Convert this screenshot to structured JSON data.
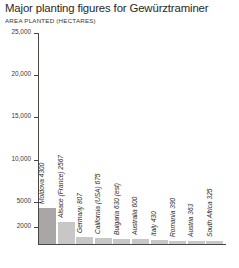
{
  "chart_data": {
    "type": "bar",
    "title": "Major planting figures for Gewürztraminer",
    "subtitle": "AREA PLANTED (HECTARES)",
    "xlabel": "",
    "ylabel": "AREA PLANTED (HECTARES)",
    "ylim": [
      0,
      25000
    ],
    "grid": false,
    "legend": "none",
    "orientation": "vertical",
    "y_ticks": [
      {
        "value": 25000,
        "label": "25,000"
      },
      {
        "value": 20000,
        "label": "20,000"
      },
      {
        "value": 15000,
        "label": "15,000"
      },
      {
        "value": 10000,
        "label": "10,000"
      },
      {
        "value": 5000,
        "label": "5000"
      },
      {
        "value": 2000,
        "label": "2000"
      }
    ],
    "categories": [
      "Moldova",
      "Alsace (France)",
      "Germany",
      "California (USA)",
      "Bulgaria",
      "Australia",
      "Italy",
      "Romania",
      "Austria",
      "South Africa"
    ],
    "values": [
      4300,
      2567,
      807,
      675,
      630,
      600,
      430,
      390,
      363,
      325
    ],
    "bar_labels": [
      "Moldova 4300",
      "Alsace (France) 2567",
      "Germany 807",
      "California (USA) 675",
      "Bulgaria 630 (est)",
      "Australia 600",
      "Italy 430",
      "Romania 390",
      "Austria 363",
      "South Africa 325"
    ],
    "highlight_index": 0,
    "colors": {
      "bar": "#c9c7c5",
      "bar_highlight": "#a9a7a5",
      "axis": "#4a4644",
      "text": "#2b2724",
      "background": "#ffffff"
    }
  }
}
